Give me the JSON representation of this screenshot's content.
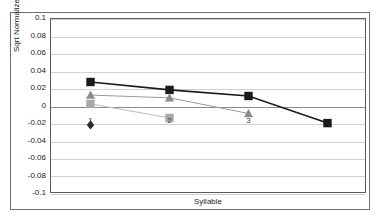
{
  "chart_data": {
    "type": "line",
    "title": "",
    "xlabel": "Syllable",
    "ylabel": "Sqrt Normalized RMS",
    "categories": [
      "1",
      "2",
      "3",
      "4"
    ],
    "ylim": [
      -0.1,
      0.1
    ],
    "ytick_labels": [
      "0.1",
      "0.08",
      "0.06",
      "0.04",
      "0.02",
      "0",
      "-0.02",
      "-0.04",
      "-0.06",
      "-0.08",
      "-0.1"
    ],
    "ytick_values": [
      0.1,
      0.08,
      0.06,
      0.04,
      0.02,
      0,
      -0.02,
      -0.04,
      -0.06,
      -0.08,
      -0.1
    ],
    "grid": true,
    "legend": "none",
    "series": [
      {
        "name": "series-1",
        "marker": "square",
        "color": "#1a1a1a",
        "line_color": "#1a1a1a",
        "line_width": 1.6,
        "values": [
          0.028,
          0.019,
          0.012,
          -0.019
        ]
      },
      {
        "name": "series-2",
        "marker": "triangle",
        "color": "#8a8a8a",
        "line_color": "#9a9a9a",
        "line_width": 1.0,
        "values": [
          0.013,
          0.01,
          -0.008,
          null
        ]
      },
      {
        "name": "series-3",
        "marker": "square",
        "color": "#a8a8a8",
        "line_color": "#bcbcbc",
        "line_width": 1.0,
        "values": [
          0.003,
          -0.013,
          null,
          null
        ]
      },
      {
        "name": "series-4",
        "marker": "diamond",
        "color": "#2a2a2a",
        "line_color": "#2a2a2a",
        "line_width": 1.0,
        "values": [
          -0.021,
          null,
          null,
          null
        ]
      }
    ],
    "category_label_positions": [
      {
        "label": "1",
        "x_index": 0,
        "y": -0.016
      },
      {
        "label": "2",
        "x_index": 1,
        "y": -0.016
      },
      {
        "label": "3",
        "x_index": 2,
        "y": -0.016
      }
    ]
  },
  "colors": {
    "frame": "#6e6e6e",
    "plot_border": "#5a5a5a",
    "grid": "#d0d0d0",
    "zero_line": "#8c8c8c",
    "background": "#ffffff",
    "text": "#1a1a1a"
  }
}
